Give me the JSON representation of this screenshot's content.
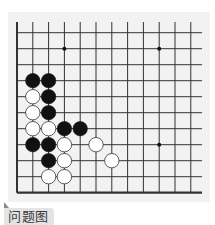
{
  "caption": {
    "label": "问题图"
  },
  "board": {
    "background": "#f2f2f2",
    "line_color": "#333333",
    "cols": 12,
    "rows": 11,
    "origin_x": 17,
    "origin_y": 32.7,
    "spacing_x": 15.8,
    "spacing_y": 16.0,
    "edges": {
      "left": true,
      "bottom": true,
      "top": false,
      "right": false
    },
    "star_points": [
      {
        "col": 3,
        "row": 1
      },
      {
        "col": 9,
        "row": 1
      },
      {
        "col": 9,
        "row": 7
      }
    ],
    "stones": [
      {
        "color": "black",
        "col": 1,
        "row": 3
      },
      {
        "color": "black",
        "col": 2,
        "row": 3
      },
      {
        "color": "white",
        "col": 1,
        "row": 4
      },
      {
        "color": "black",
        "col": 2,
        "row": 4
      },
      {
        "color": "white",
        "col": 1,
        "row": 5
      },
      {
        "color": "black",
        "col": 2,
        "row": 5
      },
      {
        "color": "white",
        "col": 1,
        "row": 6
      },
      {
        "color": "white",
        "col": 2,
        "row": 6
      },
      {
        "color": "black",
        "col": 3,
        "row": 6
      },
      {
        "color": "black",
        "col": 4,
        "row": 6
      },
      {
        "color": "black",
        "col": 1,
        "row": 7
      },
      {
        "color": "black",
        "col": 2,
        "row": 7
      },
      {
        "color": "white",
        "col": 3,
        "row": 7
      },
      {
        "color": "white",
        "col": 5,
        "row": 7
      },
      {
        "color": "black",
        "col": 2,
        "row": 8
      },
      {
        "color": "white",
        "col": 3,
        "row": 8
      },
      {
        "color": "white",
        "col": 6,
        "row": 8
      },
      {
        "color": "white",
        "col": 2,
        "row": 9
      },
      {
        "color": "white",
        "col": 3,
        "row": 9
      }
    ]
  }
}
